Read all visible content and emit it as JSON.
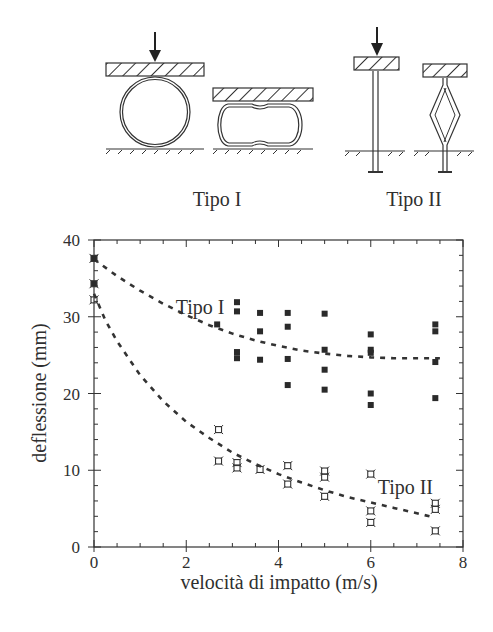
{
  "diagram": {
    "type_1_label": "Tipo I",
    "type_2_label": "Tipo II"
  },
  "chart_data": {
    "type": "scatter",
    "title": "",
    "xlabel": "velocità di impatto (m/s)",
    "ylabel": "deflessione (mm)",
    "xlim": [
      0,
      8
    ],
    "ylim": [
      0,
      40
    ],
    "xticks": [
      0,
      2,
      4,
      6,
      8
    ],
    "xtick_labels": [
      "0",
      "2",
      "4",
      "6",
      "8"
    ],
    "yticks": [
      0,
      10,
      20,
      30,
      40
    ],
    "ytick_labels": [
      "0",
      "10",
      "20",
      "30",
      "40"
    ],
    "grid": false,
    "legend": "inline annotations",
    "annotations": [
      {
        "text": "Tipo I",
        "x": 2.3,
        "y": 30.3
      },
      {
        "text": "Tipo II",
        "x": 6.75,
        "y": 6.9
      }
    ],
    "series": [
      {
        "name": "Tipo I",
        "marker": "filled-square",
        "points": [
          [
            0.0,
            37.6
          ],
          [
            0.0,
            34.3
          ],
          [
            2.67,
            29.0
          ],
          [
            3.1,
            31.9
          ],
          [
            3.1,
            30.7
          ],
          [
            3.1,
            25.4
          ],
          [
            3.1,
            24.6
          ],
          [
            3.6,
            30.5
          ],
          [
            3.6,
            28.1
          ],
          [
            3.6,
            24.4
          ],
          [
            4.2,
            30.5
          ],
          [
            4.2,
            28.7
          ],
          [
            4.2,
            24.5
          ],
          [
            4.2,
            21.1
          ],
          [
            5.0,
            30.4
          ],
          [
            5.0,
            25.7
          ],
          [
            5.0,
            23.1
          ],
          [
            5.0,
            20.5
          ],
          [
            6.0,
            27.7
          ],
          [
            6.0,
            25.7
          ],
          [
            6.0,
            25.3
          ],
          [
            6.0,
            20.0
          ],
          [
            6.0,
            18.5
          ],
          [
            7.4,
            29.0
          ],
          [
            7.4,
            28.1
          ],
          [
            7.4,
            24.1
          ],
          [
            7.4,
            19.4
          ]
        ],
        "fit_curve": {
          "style": "dashed",
          "x": [
            0,
            0.5,
            1,
            1.5,
            2,
            2.5,
            3,
            3.5,
            4,
            4.5,
            5,
            5.5,
            6,
            6.5,
            7,
            7.5
          ],
          "y": [
            37.5,
            35.3,
            33.4,
            31.7,
            30.2,
            28.9,
            27.8,
            26.9,
            26.2,
            25.6,
            25.2,
            24.9,
            24.7,
            24.6,
            24.6,
            24.6
          ]
        }
      },
      {
        "name": "Tipo II",
        "marker": "open-star-square",
        "points": [
          [
            0.0,
            37.6
          ],
          [
            0.0,
            34.3
          ],
          [
            0.0,
            32.2
          ],
          [
            2.7,
            15.3
          ],
          [
            2.7,
            11.2
          ],
          [
            3.1,
            11.0
          ],
          [
            3.1,
            10.3
          ],
          [
            3.6,
            10.1
          ],
          [
            4.2,
            10.6
          ],
          [
            4.2,
            8.2
          ],
          [
            5.0,
            9.9
          ],
          [
            5.0,
            9.1
          ],
          [
            5.0,
            6.6
          ],
          [
            6.0,
            9.5
          ],
          [
            6.0,
            4.7
          ],
          [
            6.0,
            3.2
          ],
          [
            7.4,
            5.7
          ],
          [
            7.4,
            4.9
          ],
          [
            7.4,
            2.1
          ]
        ],
        "fit_curve": {
          "style": "dashed",
          "x": [
            0,
            0.25,
            0.5,
            1,
            1.5,
            2,
            2.5,
            3,
            3.5,
            4,
            4.5,
            5,
            5.5,
            6,
            6.5,
            7,
            7.4
          ],
          "y": [
            33.0,
            29.5,
            26.8,
            22.4,
            19.0,
            16.3,
            14.2,
            12.3,
            10.8,
            9.5,
            8.4,
            7.4,
            6.5,
            5.8,
            5.1,
            4.4,
            3.8
          ]
        }
      }
    ]
  }
}
